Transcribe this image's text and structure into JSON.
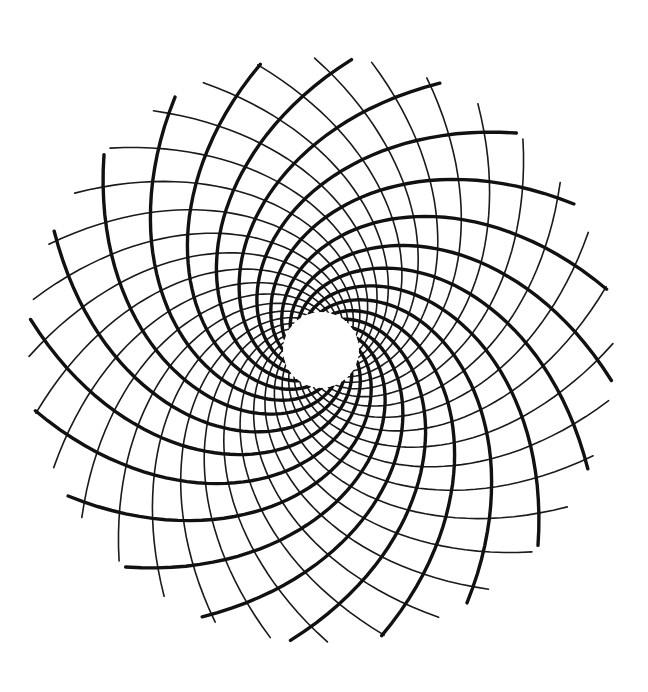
{
  "figure": {
    "background": "#ffffff",
    "ink": "#111111",
    "center": [
      321,
      350
    ],
    "inner_radius": 38,
    "outer_radius": 292,
    "thick_spirals": {
      "count": 20,
      "twist_degrees": 150,
      "direction": "clockwise",
      "stroke_width": 3.4
    },
    "thin_spirals": {
      "count": 32,
      "twist_degrees": -125,
      "direction": "counterclockwise",
      "stroke_width": 1.6
    }
  }
}
